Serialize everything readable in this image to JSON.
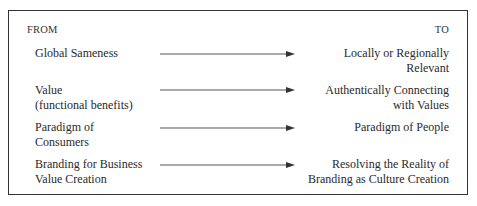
{
  "diagram": {
    "header_from": "FROM",
    "header_to": "TO",
    "rows": [
      {
        "from": [
          "Global Sameness"
        ],
        "to": [
          "Locally or Regionally",
          "Relevant"
        ]
      },
      {
        "from": [
          "Value",
          "(functional benefits)"
        ],
        "to": [
          "Authentically Connecting",
          "with Values"
        ]
      },
      {
        "from": [
          "Paradigm of",
          "Consumers"
        ],
        "to": [
          "Paradigm of People"
        ]
      },
      {
        "from": [
          "Branding for Business",
          "Value Creation"
        ],
        "to": [
          "Resolving the Reality of",
          "Branding as Culture Creation"
        ]
      }
    ],
    "colors": {
      "text": "#2a2a2a",
      "border": "#333333",
      "arrow": "#555555"
    }
  }
}
